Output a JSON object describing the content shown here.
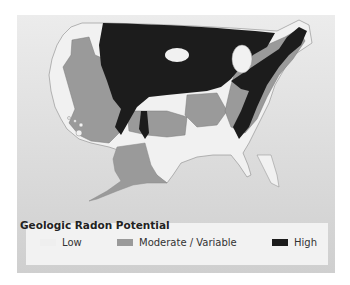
{
  "legend": {
    "title": "Geologic Radon Potential",
    "items": [
      {
        "label": "Low",
        "color": "#f1f1f1"
      },
      {
        "label": "Moderate / Variable",
        "color": "#9a9a9a"
      },
      {
        "label": "High",
        "color": "#1c1c1c"
      }
    ]
  },
  "colors": {
    "background": "#dedede",
    "low": "#f1f1f1",
    "moderate": "#9a9a9a",
    "high": "#1c1c1c",
    "outline": "#7a7a7a"
  }
}
